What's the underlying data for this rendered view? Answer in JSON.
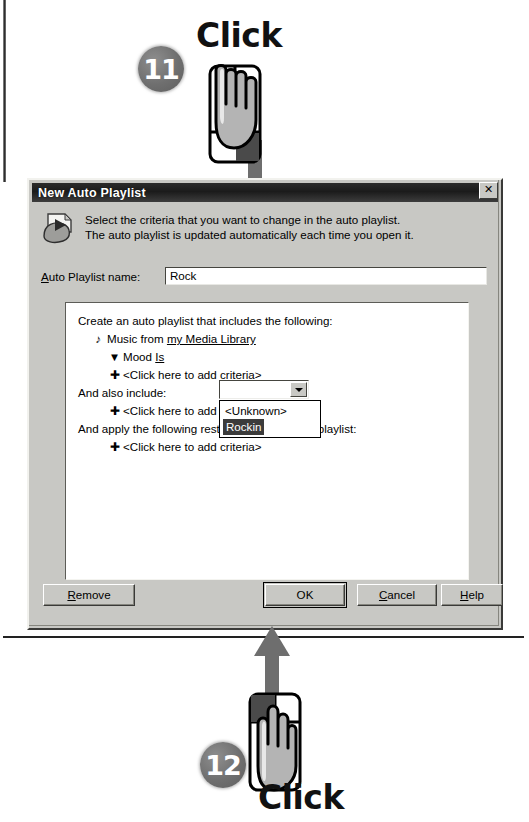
{
  "annotations": {
    "top": {
      "step_number": "11",
      "label": "Click",
      "icon": "hand-pointer-mouse-icon",
      "arrow": "down-arrow-icon"
    },
    "bottom": {
      "step_number": "12",
      "label": "Click",
      "icon": "hand-pointer-mouse-icon",
      "arrow": "up-arrow-icon"
    }
  },
  "dialog": {
    "title": "New Auto Playlist",
    "close_label": "✕",
    "icon": "media-playlist-icon",
    "description_line1": "Select the criteria that you want to change in the auto playlist.",
    "description_line2": "The auto playlist is updated automatically each time you open it.",
    "name_field": {
      "label": "Auto Playlist name:",
      "label_accesskey": "A",
      "value": "Rock",
      "placeholder": ""
    },
    "criteria": {
      "heading": "Create an auto playlist that includes the following:",
      "rows": [
        {
          "icon": "music-note-icon",
          "text": "Music from my Media Library",
          "link_text": "my Media Library",
          "indent": 1
        },
        {
          "icon": "filter-funnel-icon",
          "text": "Mood Is",
          "link_text": "Is",
          "indent": 2
        },
        {
          "icon": "plus-icon",
          "text": "<Click here to add criteria>",
          "indent": 2
        }
      ],
      "also_include_label": "And also include:",
      "also_include_rows": [
        {
          "icon": "plus-icon",
          "text": "<Click here to add criteria>",
          "indent": 2
        }
      ],
      "restrictions_label": "And apply the following restrictions to the auto playlist:",
      "restriction_rows": [
        {
          "icon": "plus-icon",
          "text": "<Click here to add criteria>",
          "indent": 2
        }
      ]
    },
    "combobox": {
      "value": "",
      "placeholder": "",
      "arrow_icon": "chevron-down-icon",
      "options": [
        {
          "label": "<Unknown>",
          "selected": false
        },
        {
          "label": "Rockin",
          "selected": true
        }
      ]
    },
    "buttons": {
      "remove": "Remove",
      "ok": "OK",
      "cancel": "Cancel",
      "help": "Help"
    }
  },
  "colors": {
    "dialog_face": "#c8c8c4",
    "titlebar": "#1b1b1b",
    "badge": "#6f6f6f",
    "arrow": "#6a6a6a",
    "selection": "#3b3b3b",
    "field_bg": "#ffffff"
  }
}
